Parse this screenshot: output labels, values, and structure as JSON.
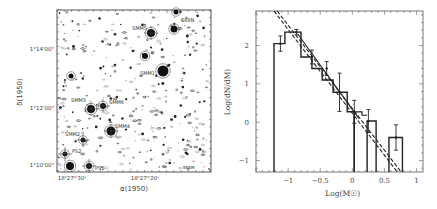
{
  "figure": {
    "left_panel": {
      "type": "contour_map",
      "xlabel": "α(1950)",
      "ylabel": "δ(1950)",
      "x_ticks": [
        "18h27m30s",
        "18h27m20s"
      ],
      "y_ticks": [
        "1°14'00\"",
        "1°12'00\"",
        "1°10'00\""
      ],
      "sources": [
        {
          "label": "SMM5",
          "x": 150,
          "y": 33
        },
        {
          "label": "S68N",
          "x": 183,
          "y": 20
        },
        {
          "label": "SMM1",
          "x": 162,
          "y": 70
        },
        {
          "label": "SMM3",
          "x": 91,
          "y": 108
        },
        {
          "label": "SMM6",
          "x": 103,
          "y": 106
        },
        {
          "label": "SMM4",
          "x": 110,
          "y": 131
        },
        {
          "label": "SMM2",
          "x": 83,
          "y": 140
        },
        {
          "label": "PS2",
          "x": 65,
          "y": 155
        },
        {
          "label": "PS1",
          "x": 89,
          "y": 166
        }
      ],
      "beam_label": "BEAM"
    },
    "right_panel_labels": {
      "xlabel": "Log(M☉)",
      "ylabel": "Log(dN/dM)"
    }
  },
  "chart_data": {
    "type": "bar",
    "title": "",
    "xlabel": "Log(M☉)",
    "ylabel": "Log(dN/dM)",
    "xlim": [
      -1.5,
      1.1
    ],
    "ylim": [
      -1.3,
      2.9
    ],
    "x_ticks": [
      -1,
      -0.5,
      0,
      0.5,
      1
    ],
    "y_ticks": [
      -1,
      0,
      1,
      2
    ],
    "grid": false,
    "histogram": {
      "bin_edges": [
        -1.22,
        -1.05,
        -0.8,
        -0.63,
        -0.47,
        -0.3,
        -0.08,
        0.03,
        0.23,
        0.37,
        0.57,
        0.78
      ],
      "heights": [
        2.05,
        2.35,
        1.7,
        1.4,
        1.1,
        0.78,
        0.27,
        0.27,
        0.03,
        null,
        -0.4
      ],
      "error_bar_points": [
        {
          "x": -1.12,
          "y": 2.05,
          "err": 0.2
        },
        {
          "x": -0.87,
          "y": 2.35,
          "err": 0.07
        },
        {
          "x": -0.63,
          "y": 1.7,
          "err": 0.18
        },
        {
          "x": -0.4,
          "y": 1.4,
          "err": 0.18
        },
        {
          "x": -0.2,
          "y": 0.78,
          "err": 0.5
        },
        {
          "x": 0.03,
          "y": 0.27,
          "err": 0.3
        },
        {
          "x": 0.25,
          "y": 0.03,
          "err": 0.3
        },
        {
          "x": 0.68,
          "y": -0.4,
          "err": 0.33
        }
      ]
    },
    "series": [
      {
        "name": "fit-solid",
        "style": "solid",
        "points": [
          [
            -0.85,
            2.3
          ],
          [
            0.1,
            0.1
          ]
        ]
      },
      {
        "name": "fit-dashed-1",
        "style": "dashed",
        "points": [
          [
            -1.22,
            2.9
          ],
          [
            0.7,
            -1.3
          ]
        ]
      },
      {
        "name": "fit-dashed-2",
        "style": "dashed",
        "points": [
          [
            -1.17,
            2.9
          ],
          [
            0.76,
            -1.3
          ]
        ]
      }
    ]
  }
}
